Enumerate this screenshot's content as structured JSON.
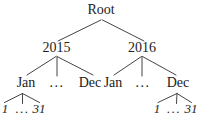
{
  "tree": {
    "root": {
      "label": "Root"
    },
    "year_2015": {
      "label": "2015",
      "months": {
        "jan": "Jan",
        "ellipsis": "...",
        "dec": "Dec"
      }
    },
    "year_2016": {
      "label": "2016",
      "months": {
        "jan": "Jan",
        "ellipsis": "...",
        "dec": "Dec"
      }
    },
    "days_2015_jan": {
      "first": "1",
      "ellipsis": "...",
      "last": "31"
    },
    "days_2016_dec": {
      "first": "1",
      "ellipsis": "...",
      "last": "31"
    }
  },
  "colors": {
    "text": "#222222",
    "edge": "#444444",
    "background": "#ffffff"
  }
}
